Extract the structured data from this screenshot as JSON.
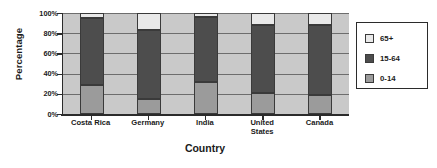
{
  "chart_data": {
    "type": "bar",
    "subtype": "stacked-percentage",
    "title": "",
    "xlabel": "Country",
    "ylabel": "Percentage",
    "categories": [
      "Costa Rica",
      "Germany",
      "India",
      "United States",
      "Canada"
    ],
    "category_labels_multiline": [
      "Costa Rica",
      "Germany",
      "India",
      "United\nStates",
      "Canada"
    ],
    "series": [
      {
        "name": "0-14",
        "values": [
          29,
          15,
          32,
          21,
          19
        ],
        "color": "#9b9b9b"
      },
      {
        "name": "15-64",
        "values": [
          66,
          68,
          64,
          67,
          69
        ],
        "color": "#4d4d4d"
      },
      {
        "name": "65+",
        "values": [
          5,
          17,
          4,
          12,
          12
        ],
        "color": "#e9e9e9"
      }
    ],
    "stack_order_bottom_to_top": [
      "0-14",
      "15-64",
      "65+"
    ],
    "ylim": [
      0,
      100
    ],
    "ytick_labels": [
      "0%",
      "20%",
      "40%",
      "60%",
      "80%",
      "100%"
    ],
    "ytick_values": [
      0,
      20,
      40,
      60,
      80,
      100
    ],
    "grid": true,
    "legend_position": "right",
    "legend_entries": [
      {
        "label": "65+",
        "color": "#e9e9e9"
      },
      {
        "label": "15-64",
        "color": "#4d4d4d"
      },
      {
        "label": "0-14",
        "color": "#9b9b9b"
      }
    ],
    "plot_background": "#c9c9c9",
    "axis_color": "#2b2b2b",
    "gridline_color": "#6d6d6d"
  }
}
